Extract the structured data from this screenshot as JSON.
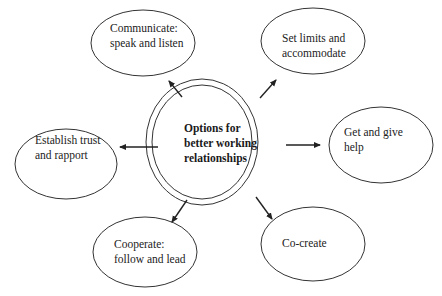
{
  "diagram": {
    "center": {
      "line1": "Options for",
      "line2": "better working",
      "line3": "relationships"
    },
    "nodes": [
      {
        "id": "communicate",
        "line1": "Communicate:",
        "line2": "speak and listen"
      },
      {
        "id": "set-limits",
        "line1": "Set limits and",
        "line2": "accommodate"
      },
      {
        "id": "establish-trust",
        "line1": "Establish trust",
        "line2": "and rapport"
      },
      {
        "id": "get-give-help",
        "line1": "Get and give",
        "line2": "help"
      },
      {
        "id": "cooperate",
        "line1": "Cooperate:",
        "line2": "follow and lead"
      },
      {
        "id": "co-create",
        "line1": "Co-create",
        "line2": ""
      }
    ],
    "colors": {
      "stroke": "#333333",
      "background": "#ffffff",
      "text": "#222222"
    }
  }
}
